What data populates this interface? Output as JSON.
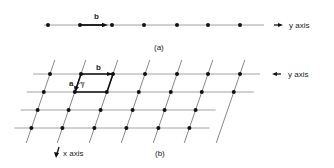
{
  "panel_a": {
    "caption": "(a)",
    "vector_label": "b",
    "axis_label": "y axis",
    "line": {
      "y": 25,
      "x1": 44,
      "x2": 264
    },
    "points_x": [
      48,
      80,
      112,
      144,
      177,
      208,
      240
    ],
    "vector": {
      "x1": 80,
      "x2": 108
    }
  },
  "panel_b": {
    "caption": "(b)",
    "vector_a_label": "a",
    "vector_b_label": "b",
    "angle_label": "γ",
    "y_axis_label": "y axis",
    "x_axis_label": "x axis",
    "rows_y": [
      74,
      92,
      110,
      128
    ],
    "row_shift": -6.2,
    "top_row_points_x": [
      50,
      81,
      113,
      145,
      177,
      208,
      240
    ],
    "row_extent": {
      "left": -17,
      "right": 20
    }
  },
  "colors": {
    "line": "#8a8a8a",
    "point": "#111111",
    "vector": "#111111",
    "text": "#222222"
  }
}
